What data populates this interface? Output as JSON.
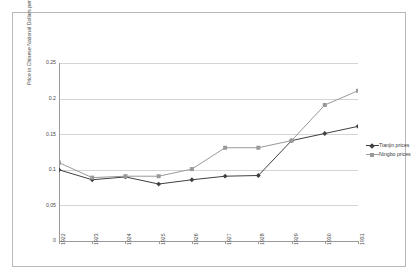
{
  "chart_data": {
    "type": "line",
    "title": "",
    "xlabel": "",
    "ylabel": "Price in Chinese National Dollars per picul",
    "categories": [
      "1922",
      "1923",
      "1924",
      "1925",
      "1926",
      "1927",
      "1928",
      "1929",
      "1930",
      "1931"
    ],
    "ylim": [
      0,
      0.25
    ],
    "yticks": [
      "0",
      "0.05",
      "0.1",
      "0.15",
      "0.2",
      "0.25"
    ],
    "ytick_values": [
      0,
      0.05,
      0.1,
      0.15,
      0.2,
      0.25
    ],
    "grid": true,
    "legend_position": "right",
    "series": [
      {
        "name": "Tianjin prices",
        "color": "#404040",
        "marker": "diamond",
        "values": [
          0.1,
          0.086,
          0.09,
          0.08,
          0.086,
          0.091,
          0.092,
          0.141,
          0.151,
          0.161
        ]
      },
      {
        "name": "Ningbo prices",
        "color": "#9a9a9a",
        "marker": "square",
        "values": [
          0.11,
          0.089,
          0.091,
          0.091,
          0.101,
          0.131,
          0.131,
          0.141,
          0.191,
          0.211
        ]
      }
    ]
  }
}
